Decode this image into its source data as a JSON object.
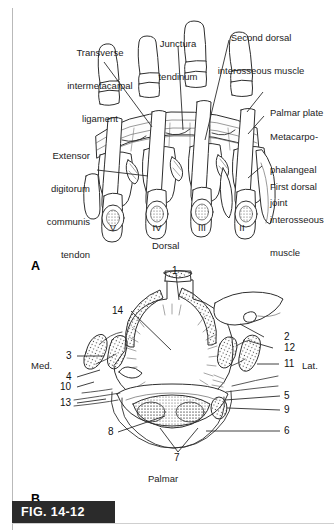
{
  "figure": {
    "caption_tag": "FIG. 14-12",
    "panels": [
      {
        "letter": "A",
        "view": "Dorsal"
      },
      {
        "letter": "B",
        "view": "Palmar"
      }
    ]
  },
  "panel_a": {
    "letter": "A",
    "orientation_label": "Dorsal",
    "digit_numerals": [
      "V",
      "IV",
      "III",
      "II"
    ],
    "labels": [
      {
        "id": "transverse-intermetacarpal-ligament",
        "lines": [
          "Transverse",
          "intermetacarpal",
          "ligament"
        ],
        "align": "center"
      },
      {
        "id": "junctura-tendinum",
        "lines": [
          "Junctura",
          "tendinum"
        ],
        "align": "center"
      },
      {
        "id": "second-dorsal-interosseous-muscle",
        "lines": [
          "Second dorsal",
          "interosseous muscle"
        ],
        "align": "center"
      },
      {
        "id": "palmar-plate",
        "lines": [
          "Palmar plate"
        ],
        "align": "left"
      },
      {
        "id": "metacarpophalangeal-joint",
        "lines": [
          "Metacarpo-",
          "phalangeal",
          "joint"
        ],
        "align": "left"
      },
      {
        "id": "first-dorsal-interosseous-muscle",
        "lines": [
          "First dorsal",
          "interosseous",
          "muscle"
        ],
        "align": "left"
      },
      {
        "id": "extensor-digitorum-communis-tendon",
        "lines": [
          "Extensor",
          "digitorum",
          "communis",
          "tendon"
        ],
        "align": "right"
      }
    ]
  },
  "panel_b": {
    "letter": "B",
    "orientation_label": "Palmar",
    "side_label_medial": "Med.",
    "side_label_lateral": "Lat.",
    "callouts": {
      "top": [
        "1"
      ],
      "inner": [
        "14"
      ],
      "left": [
        "3",
        "4",
        "10",
        "13"
      ],
      "right": [
        "2",
        "12",
        "11",
        "5",
        "9",
        "6"
      ],
      "bottom": [
        "8",
        "7"
      ]
    },
    "callout_list": [
      "1",
      "2",
      "3",
      "4",
      "5",
      "6",
      "7",
      "8",
      "9",
      "10",
      "11",
      "12",
      "13",
      "14"
    ]
  },
  "colors": {
    "ink": "#1a1a1a",
    "line": "#3a3a3a",
    "paper": "#ffffff",
    "caption_bar": "#2b2b2b",
    "caption_text": "#ffffff",
    "margin_rule": "#b9b9b9",
    "shade": "#e8e8e8"
  }
}
